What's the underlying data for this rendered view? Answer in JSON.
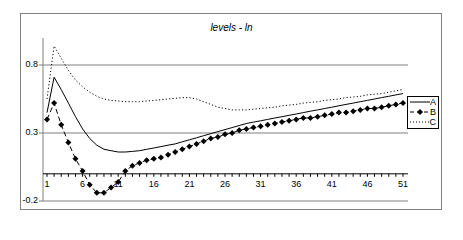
{
  "chart_data": {
    "type": "line",
    "title": "levels - ln",
    "xlabel": "",
    "ylabel": "",
    "ylim": [
      -0.2,
      1.0
    ],
    "grid": "horizontal at 0.8, 0.3, -0.2",
    "legend_position": "right",
    "x_ticks": [
      "1",
      "6",
      "11",
      "16",
      "21",
      "26",
      "31",
      "36",
      "41",
      "46",
      "51"
    ],
    "y_ticks": [
      "0.8",
      "0.3",
      "-0.2"
    ],
    "x": [
      1,
      2,
      3,
      4,
      5,
      6,
      7,
      8,
      9,
      10,
      11,
      12,
      13,
      14,
      15,
      16,
      17,
      18,
      19,
      20,
      21,
      22,
      23,
      24,
      25,
      26,
      27,
      28,
      29,
      30,
      31,
      32,
      33,
      34,
      35,
      36,
      37,
      38,
      39,
      40,
      41,
      42,
      43,
      44,
      45,
      46,
      47,
      48,
      49,
      50,
      51
    ],
    "series": [
      {
        "name": "A",
        "style": "solid",
        "values": [
          0.45,
          0.71,
          0.62,
          0.52,
          0.42,
          0.33,
          0.26,
          0.21,
          0.18,
          0.17,
          0.16,
          0.16,
          0.165,
          0.17,
          0.18,
          0.19,
          0.2,
          0.21,
          0.22,
          0.235,
          0.25,
          0.265,
          0.28,
          0.295,
          0.31,
          0.325,
          0.34,
          0.355,
          0.37,
          0.38,
          0.39,
          0.4,
          0.41,
          0.42,
          0.43,
          0.44,
          0.45,
          0.46,
          0.47,
          0.48,
          0.49,
          0.5,
          0.51,
          0.52,
          0.53,
          0.54,
          0.55,
          0.56,
          0.57,
          0.58,
          0.59
        ]
      },
      {
        "name": "B",
        "style": "dashed-diamond",
        "values": [
          0.4,
          0.52,
          0.36,
          0.23,
          0.11,
          0.02,
          -0.08,
          -0.14,
          -0.14,
          -0.1,
          -0.06,
          0.02,
          0.06,
          0.08,
          0.1,
          0.11,
          0.12,
          0.14,
          0.16,
          0.18,
          0.2,
          0.22,
          0.24,
          0.26,
          0.27,
          0.29,
          0.3,
          0.32,
          0.33,
          0.34,
          0.35,
          0.36,
          0.37,
          0.38,
          0.39,
          0.4,
          0.41,
          0.41,
          0.42,
          0.43,
          0.44,
          0.45,
          0.45,
          0.46,
          0.47,
          0.48,
          0.48,
          0.49,
          0.5,
          0.51,
          0.52
        ]
      },
      {
        "name": "C",
        "style": "dotted",
        "values": [
          0.55,
          0.94,
          0.85,
          0.76,
          0.69,
          0.64,
          0.6,
          0.57,
          0.55,
          0.54,
          0.535,
          0.53,
          0.53,
          0.53,
          0.535,
          0.54,
          0.545,
          0.55,
          0.555,
          0.56,
          0.56,
          0.55,
          0.53,
          0.51,
          0.49,
          0.48,
          0.47,
          0.47,
          0.47,
          0.475,
          0.48,
          0.485,
          0.49,
          0.5,
          0.505,
          0.51,
          0.52,
          0.525,
          0.53,
          0.54,
          0.545,
          0.55,
          0.56,
          0.565,
          0.57,
          0.58,
          0.585,
          0.59,
          0.6,
          0.61,
          0.62
        ]
      }
    ]
  },
  "legend": {
    "items": [
      {
        "label": "A"
      },
      {
        "label": "B"
      },
      {
        "label": "C"
      }
    ]
  }
}
